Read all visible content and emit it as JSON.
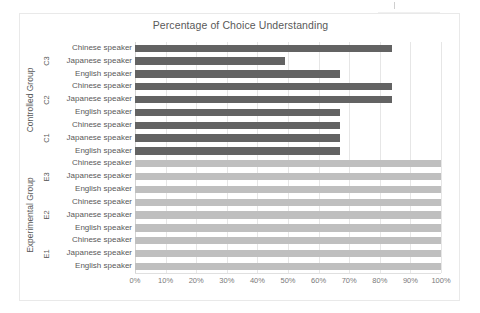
{
  "chart_data": {
    "type": "bar",
    "orientation": "horizontal",
    "title": "Percentage of Choice Understanding",
    "xlabel": "",
    "ylabel": "",
    "xlim": [
      0,
      100
    ],
    "grid": true,
    "legend": "none",
    "xticks": [
      "0%",
      "10%",
      "20%",
      "30%",
      "40%",
      "50%",
      "60%",
      "70%",
      "80%",
      "90%",
      "100%"
    ],
    "xtick_values": [
      0,
      10,
      20,
      30,
      40,
      50,
      60,
      70,
      80,
      90,
      100
    ],
    "groups": [
      {
        "name": "Controlled Group",
        "color": "#636363",
        "conditions": [
          {
            "name": "C3",
            "categories": [
              "Chinese speaker",
              "Japanese speaker",
              "English speaker"
            ],
            "values": [
              84,
              49,
              67
            ]
          },
          {
            "name": "C2",
            "categories": [
              "Chinese speaker",
              "Japanese speaker",
              "English speaker"
            ],
            "values": [
              84,
              84,
              67
            ]
          },
          {
            "name": "C1",
            "categories": [
              "Chinese speaker",
              "Japanese speaker",
              "English speaker"
            ],
            "values": [
              67,
              67,
              67
            ]
          }
        ]
      },
      {
        "name": "Experimental Group",
        "color": "#bfbfbf",
        "conditions": [
          {
            "name": "E3",
            "categories": [
              "Chinese speaker",
              "Japanese speaker",
              "English speaker"
            ],
            "values": [
              100,
              100,
              100
            ]
          },
          {
            "name": "E2",
            "categories": [
              "Chinese speaker",
              "Japanese speaker",
              "English speaker"
            ],
            "values": [
              100,
              100,
              100
            ]
          },
          {
            "name": "E1",
            "categories": [
              "Chinese speaker",
              "Japanese speaker",
              "English speaker"
            ],
            "values": [
              100,
              100,
              100
            ]
          }
        ]
      }
    ],
    "colors": {
      "controlled_bar": "#636363",
      "experimental_bar": "#bfbfbf",
      "gridline": "#e6e6e6",
      "text": "#595959",
      "frame": "#e9e9e9"
    }
  }
}
